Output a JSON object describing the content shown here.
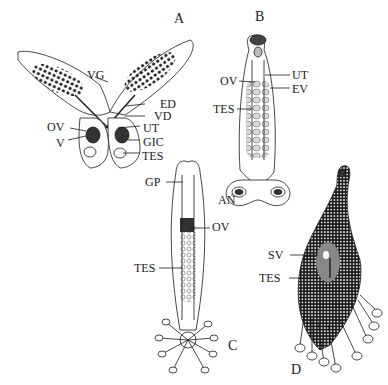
{
  "figure": {
    "panels": [
      {
        "id": "A",
        "label": "A",
        "labels": [
          "VG",
          "ED",
          "VD",
          "OV",
          "UT",
          "V",
          "GIC",
          "TES"
        ]
      },
      {
        "id": "B",
        "label": "B",
        "labels": [
          "OV",
          "UT",
          "EV",
          "TES",
          "AN"
        ]
      },
      {
        "id": "C",
        "label": "C",
        "labels": [
          "GP",
          "OV",
          "TES"
        ]
      },
      {
        "id": "D",
        "label": "D",
        "labels": [
          "SV",
          "TES"
        ]
      }
    ]
  },
  "A": {
    "panel": "A",
    "vg": "VG",
    "ed": "ED",
    "vd": "VD",
    "ov": "OV",
    "ut": "UT",
    "v": "V",
    "gic": "GIC",
    "tes": "TES"
  },
  "B": {
    "panel": "B",
    "ov": "OV",
    "ut": "UT",
    "ev": "EV",
    "tes": "TES",
    "an": "AN"
  },
  "C": {
    "panel": "C",
    "gp": "GP",
    "ov": "OV",
    "tes": "TES"
  },
  "D": {
    "panel": "D",
    "sv": "SV",
    "tes": "TES"
  },
  "colors": {
    "ink": "#1a1a1a",
    "background": "#ffffff",
    "stipple": "#2a2a2a"
  }
}
